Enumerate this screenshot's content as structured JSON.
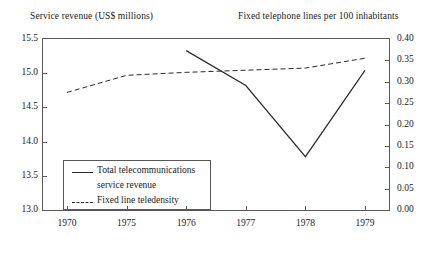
{
  "titles": {
    "left_axis": "Service revenue (US$ millions)",
    "right_axis": "Fixed telephone lines per 100 inhabitants"
  },
  "legend": {
    "series1_line1": "Total telecommunications",
    "series1_line2": "service revenue",
    "series2": "Fixed line teledensity"
  },
  "colors": {
    "line": "#2a2a2a",
    "frame": "#58585a",
    "background": "#ffffff"
  },
  "chart_data": {
    "type": "line",
    "title": "",
    "xlabel": "",
    "ylabel": "Service revenue (US$ millions)",
    "y2label": "Fixed telephone lines per 100 inhabitants",
    "categories": [
      "1970",
      "1975",
      "1976",
      "1977",
      "1978",
      "1979"
    ],
    "ylim": [
      13.0,
      15.5
    ],
    "yticks": [
      "13.0",
      "13.5",
      "14.0",
      "14.5",
      "15.0",
      "15.5"
    ],
    "y2lim": [
      0.0,
      0.4
    ],
    "y2ticks": [
      "0.00",
      "0.05",
      "0.10",
      "0.15",
      "0.20",
      "0.25",
      "0.30",
      "0.35",
      "0.40"
    ],
    "grid": false,
    "legend_position": "lower-left",
    "series": [
      {
        "name": "Total telecommunications service revenue",
        "axis": "left",
        "style": "solid",
        "x": [
          "1976",
          "1977",
          "1978",
          "1979"
        ],
        "values": [
          15.33,
          14.82,
          13.78,
          15.04
        ]
      },
      {
        "name": "Fixed line teledensity",
        "axis": "right",
        "style": "dashed",
        "x": [
          "1970",
          "1975",
          "1976",
          "1977",
          "1978",
          "1979"
        ],
        "values": [
          0.275,
          0.315,
          0.322,
          0.327,
          0.332,
          0.355
        ]
      }
    ]
  }
}
